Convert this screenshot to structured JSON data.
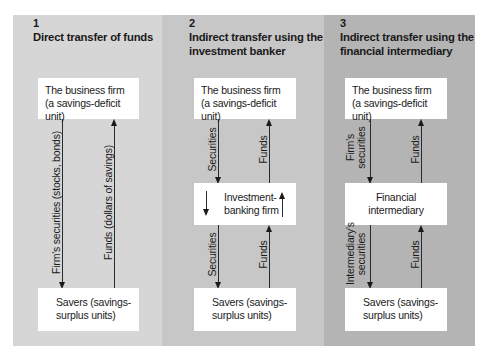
{
  "panels": [
    {
      "number": "1",
      "title_line1": "Direct transfer of funds",
      "title_line2": "",
      "top_box_line1": "The business firm",
      "top_box_line2": "(a savings-deficit unit)",
      "bottom_box_line1": "Savers (savings-",
      "bottom_box_line2": "surplus units)",
      "down_label": "Firm's securities (stocks, bonds)",
      "up_label": "Funds (dollars of savings)",
      "background": "#d6d6d6"
    },
    {
      "number": "2",
      "title_line1": "Indirect transfer using the",
      "title_line2": "investment banker",
      "top_box_line1": "The business firm",
      "top_box_line2": "(a savings-deficit unit)",
      "middle_box_line1": "Investment-",
      "middle_box_line2": "banking firm",
      "bottom_box_line1": "Savers (savings-",
      "bottom_box_line2": "surplus units)",
      "upper_down_label": "Securities",
      "upper_up_label": "Funds",
      "lower_down_label": "Securities",
      "lower_up_label": "Funds",
      "background": "#c7c7c7"
    },
    {
      "number": "3",
      "title_line1": "Indirect transfer using the",
      "title_line2": "financial intermediary",
      "top_box_line1": "The business firm",
      "top_box_line2": "(a savings-deficit unit)",
      "middle_box_line1": "Financial",
      "middle_box_line2": "intermediary",
      "bottom_box_line1": "Savers (savings-",
      "bottom_box_line2": "surplus units)",
      "upper_down_label_line1": "Firm's",
      "upper_down_label_line2": "securities",
      "upper_up_label": "Funds",
      "lower_down_label_line1": "Intermediary's",
      "lower_down_label_line2": "securities",
      "lower_up_label": "Funds",
      "background": "#b4b4b4"
    }
  ]
}
